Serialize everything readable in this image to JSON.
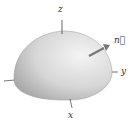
{
  "diagram": {
    "axes": {
      "z": "z",
      "y": "y",
      "x": "x"
    },
    "vector_label": "n⃗",
    "colors": {
      "surface_light": "#f2f2f2",
      "surface_dark": "#a8a8a8",
      "axis": "#555555",
      "text": "#333333"
    }
  }
}
